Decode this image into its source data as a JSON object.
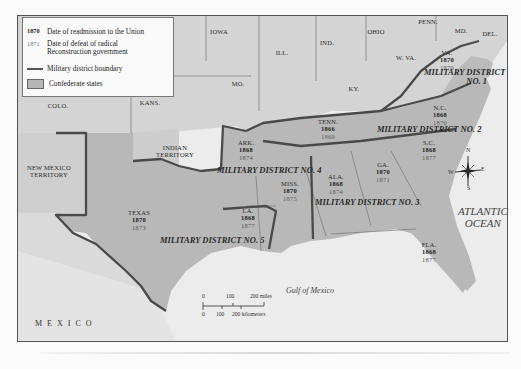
{
  "legend": {
    "items": [
      {
        "key": "1870",
        "label": "Date of readmission to the Union"
      },
      {
        "key": "1871",
        "label": "Date of defeat of radical Reconstruction government"
      },
      {
        "key": "",
        "label": "Military district boundary"
      },
      {
        "key": "",
        "label": "Confederate states"
      }
    ]
  },
  "states_nonconfederate": [
    {
      "name": "IOWA"
    },
    {
      "name": "ILL."
    },
    {
      "name": "IND."
    },
    {
      "name": "OHIO"
    },
    {
      "name": "PENN."
    },
    {
      "name": "MD."
    },
    {
      "name": "DEL."
    },
    {
      "name": "W. VA."
    },
    {
      "name": "KY."
    },
    {
      "name": "MO."
    },
    {
      "name": "KANS."
    },
    {
      "name": "COLO."
    },
    {
      "name": "INDIAN TERRITORY"
    },
    {
      "name": "NEW MEXICO TERRITORY"
    }
  ],
  "states_confederate": [
    {
      "name": "VA.",
      "readmitted": "1870",
      "redeemed": "1870"
    },
    {
      "name": "N.C.",
      "readmitted": "1868",
      "redeemed": "1870"
    },
    {
      "name": "TENN.",
      "readmitted": "1866",
      "redeemed": "1869"
    },
    {
      "name": "S.C.",
      "readmitted": "1868",
      "redeemed": "1877"
    },
    {
      "name": "GA.",
      "readmitted": "1870",
      "redeemed": "1871"
    },
    {
      "name": "ALA.",
      "readmitted": "1868",
      "redeemed": "1874"
    },
    {
      "name": "MISS.",
      "readmitted": "1870",
      "redeemed": "1875"
    },
    {
      "name": "ARK.",
      "readmitted": "1868",
      "redeemed": "1874"
    },
    {
      "name": "LA.",
      "readmitted": "1868",
      "redeemed": "1877"
    },
    {
      "name": "TEXAS",
      "readmitted": "1870",
      "redeemed": "1873"
    },
    {
      "name": "FLA.",
      "readmitted": "1868",
      "redeemed": "1877"
    }
  ],
  "districts": [
    {
      "line1": "MILITARY DISTRICT",
      "line2": "NO. 1"
    },
    {
      "line1": "MILITARY DISTRICT NO. 2"
    },
    {
      "line1": "MILITARY DISTRICT NO. 3"
    },
    {
      "line1": "MILITARY DISTRICT NO. 4"
    },
    {
      "line1": "MILITARY DISTRICT NO. 5"
    }
  ],
  "water": {
    "atlantic_line1": "ATLANTIC",
    "atlantic_line2": "OCEAN",
    "gulf": "Gulf of Mexico"
  },
  "country": {
    "mexico": "MEXICO"
  },
  "compass": {
    "n": "N",
    "s": "S",
    "e": "E",
    "w": "W"
  },
  "scale": {
    "miles": [
      "0",
      "100",
      "200 miles"
    ],
    "km": [
      "0",
      "100",
      "200 kilometers"
    ]
  },
  "colors": {
    "confederate": "#b9b9b9",
    "union": "#d6d6d6",
    "water": "#eeeeee",
    "boundary": "#4a4a4a"
  }
}
